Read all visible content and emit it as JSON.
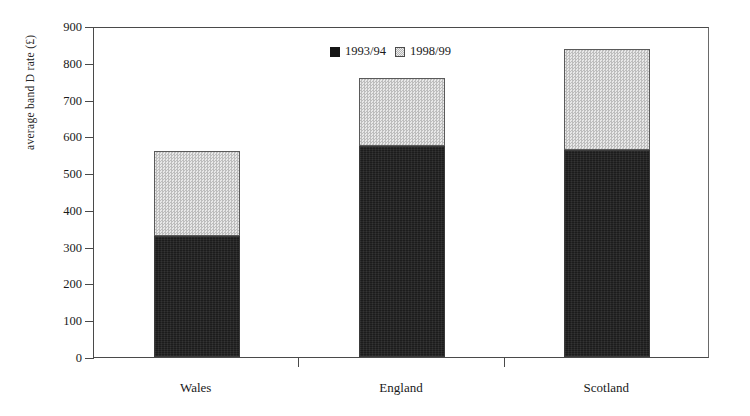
{
  "chart_data": {
    "type": "bar",
    "subtype": "stacked-vertical",
    "title": "",
    "xlabel": "",
    "ylabel": "average band D rate (£)",
    "categories": [
      "Wales",
      "England",
      "Scotland"
    ],
    "series": [
      {
        "name": "1993/94",
        "values": [
          330,
          575,
          562
        ],
        "color": "#1c1c1c",
        "pattern": "solid-dark"
      },
      {
        "name": "1998/99",
        "values": [
          230,
          183,
          276
        ],
        "color": "#d2d2d2",
        "pattern": "fine-checker"
      }
    ],
    "totals": [
      560,
      758,
      838
    ],
    "ylim": [
      0,
      900
    ],
    "ytick_interval": 100,
    "yticks": [
      0,
      100,
      200,
      300,
      400,
      500,
      600,
      700,
      800,
      900
    ],
    "ytick_labels": [
      "0",
      "100",
      "200",
      "300",
      "400",
      "500",
      "600",
      "700",
      "800",
      "900"
    ],
    "grid": false,
    "legend_position": "top-center"
  },
  "legend": {
    "entries": [
      {
        "label": "1993/94",
        "swatch": "dark-square-swatch"
      },
      {
        "label": "1998/99",
        "swatch": "light-checker-swatch"
      }
    ]
  },
  "axes": {
    "y_title": "average band D rate (£)"
  }
}
